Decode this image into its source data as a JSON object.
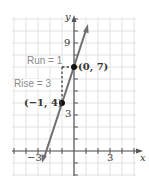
{
  "chart_data": {
    "type": "line",
    "title": "",
    "xlabel": "x",
    "ylabel": "y",
    "xlim": [
      -4,
      4
    ],
    "ylim": [
      -2,
      11
    ],
    "grid": true,
    "x_tick_labels": [
      "-3",
      "3"
    ],
    "y_tick_labels": [
      "3",
      "9"
    ],
    "series": [
      {
        "name": "y = 3x + 7",
        "x": [
          -2.6,
          1.2
        ],
        "y": [
          -0.8,
          10.6
        ],
        "color": "#6e6e6e"
      }
    ],
    "points": [
      {
        "label": "(0, 7)",
        "x": 0,
        "y": 7
      },
      {
        "label": "(−1, 4)",
        "x": -1,
        "y": 4
      }
    ],
    "annotations": [
      {
        "text": "Run = 1",
        "from": [
          -1,
          7
        ],
        "to": [
          0,
          7
        ],
        "style": "dashed"
      },
      {
        "text": "Rise = 3",
        "from": [
          -1,
          4
        ],
        "to": [
          -1,
          7
        ],
        "style": "dashed"
      }
    ]
  },
  "labels": {
    "x_axis": "x",
    "y_axis": "y",
    "tick_x_neg3": "−3",
    "tick_x_3": "3",
    "tick_y_3": "3",
    "tick_y_9": "9",
    "point_a": "(0, 7)",
    "point_b": "(−1, 4)",
    "run": "Run = 1",
    "rise": "Rise = 3"
  }
}
